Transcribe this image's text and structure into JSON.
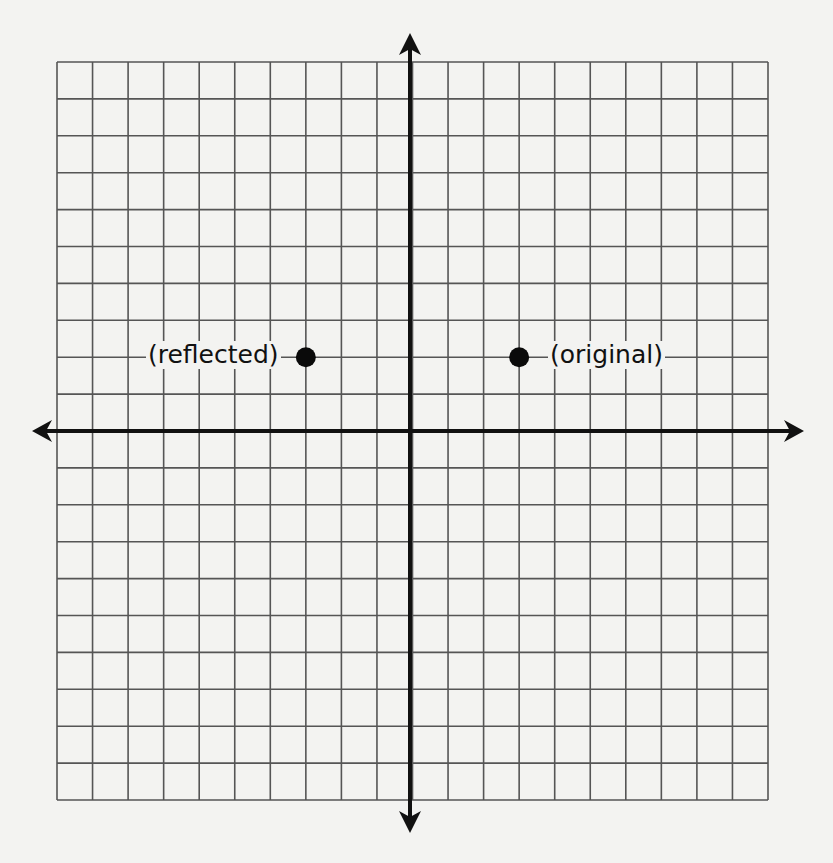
{
  "diagram": {
    "type": "coordinate-plane",
    "grid": {
      "columns": 20,
      "rows": 20,
      "x_range": [
        -10,
        10
      ],
      "y_range": [
        -10,
        10
      ]
    },
    "colors": {
      "grid": "#555555",
      "axis": "#111111",
      "point": "#0a0a0a",
      "background": "#f3f3f1"
    },
    "points": [
      {
        "id": "reflected",
        "x": -3,
        "y": 2,
        "label": "(reflected)"
      },
      {
        "id": "original",
        "x": 3,
        "y": 2,
        "label": "(original)"
      }
    ]
  },
  "chart_data": {
    "type": "scatter",
    "title": "",
    "xlabel": "",
    "ylabel": "",
    "xlim": [
      -10,
      10
    ],
    "ylim": [
      -10,
      10
    ],
    "grid": true,
    "series": [
      {
        "name": "(original)",
        "x": [
          3
        ],
        "y": [
          2
        ]
      },
      {
        "name": "(reflected)",
        "x": [
          -3
        ],
        "y": [
          2
        ]
      }
    ]
  }
}
